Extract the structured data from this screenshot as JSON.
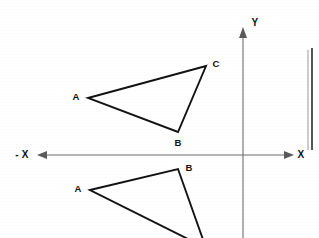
{
  "figure": {
    "background_color": "#ffffff",
    "ink_color": "#121212",
    "axis_color": "#6d6d6d",
    "width": 319,
    "height": 238
  },
  "axes": {
    "x_axis": {
      "label_positive": "X",
      "label_negative": "- X",
      "y_position": 155,
      "x_start": 38,
      "x_end": 293,
      "has_left_arrow": true,
      "has_right_arrow": true
    },
    "y_axis": {
      "label_positive": "Y",
      "x_position": 243,
      "y_top": 28,
      "y_bottom": 238,
      "has_up_arrow": true
    }
  },
  "shapes": [
    {
      "name": "upper-triangle",
      "description": "original triangle above the x-axis",
      "vertices": [
        {
          "label": "A",
          "x": 88,
          "y": 98,
          "label_x": 76,
          "label_y": 97
        },
        {
          "label": "C",
          "x": 206,
          "y": 66,
          "label_x": 216,
          "label_y": 64
        },
        {
          "label": "B",
          "x": 178,
          "y": 132,
          "label_x": 178,
          "label_y": 143
        }
      ]
    },
    {
      "name": "lower-triangle",
      "description": "reflected triangle below the x-axis, partially cropped",
      "vertices": [
        {
          "label": "A",
          "x": 90,
          "y": 190,
          "label_x": 78,
          "label_y": 189
        },
        {
          "label": "B",
          "x": 178,
          "y": 169,
          "label_x": 189,
          "label_y": 168
        },
        {
          "label": "C",
          "x": 206,
          "y": 248,
          "label_x": null,
          "label_y": null
        }
      ]
    }
  ],
  "decorations": {
    "right_margin_rule": {
      "x": 312,
      "y_top": 48,
      "y_bottom": 150
    }
  }
}
